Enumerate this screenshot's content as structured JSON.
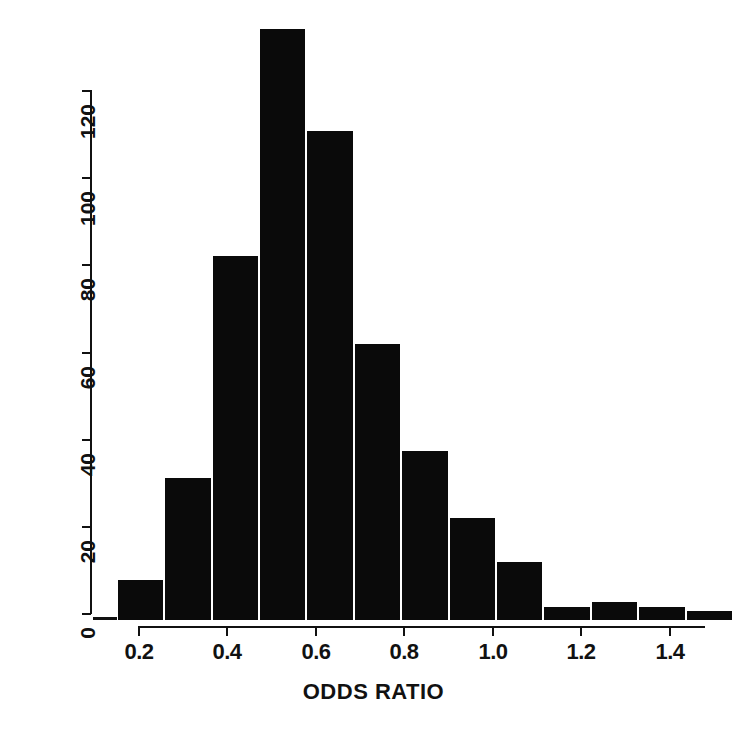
{
  "chart_data": {
    "type": "bar",
    "title": "",
    "subtitle": "",
    "xlabel": "ODDS RATIO",
    "ylabel": "",
    "xlim": [
      0.15,
      1.5
    ],
    "ylim": [
      0,
      135
    ],
    "grid": false,
    "legend": null,
    "bin_width": 0.1,
    "bar_color": "#000000",
    "background_color": "#ffffff",
    "categories": [
      "0.15-0.20",
      "0.20-0.30",
      "0.30-0.40",
      "0.40-0.50",
      "0.50-0.60",
      "0.60-0.70",
      "0.70-0.80",
      "0.80-0.90",
      "0.90-1.00",
      "1.00-1.10",
      "1.10-1.20",
      "1.20-1.30",
      "1.30-1.40",
      "1.40-1.50"
    ],
    "bin_edges": [
      0.15,
      0.2,
      0.3,
      0.4,
      0.5,
      0.6,
      0.7,
      0.8,
      0.9,
      1.0,
      1.1,
      1.2,
      1.3,
      1.4,
      1.5
    ],
    "values": [
      0,
      9,
      32,
      82,
      133,
      110,
      62,
      38,
      23,
      13,
      3,
      4,
      3,
      2
    ],
    "x_ticks": [
      0.2,
      0.4,
      0.6,
      0.8,
      1.0,
      1.2,
      1.4
    ],
    "x_tick_labels": [
      "0.2",
      "0.4",
      "0.6",
      "0.8",
      "1.0",
      "1.2",
      "1.4"
    ],
    "y_ticks": [
      0,
      20,
      40,
      60,
      80,
      100,
      120
    ],
    "y_tick_labels": [
      "0",
      "20",
      "40",
      "60",
      "80",
      "100",
      "120"
    ]
  },
  "axes": {
    "x_title": "ODDS RATIO",
    "y_title": ""
  }
}
